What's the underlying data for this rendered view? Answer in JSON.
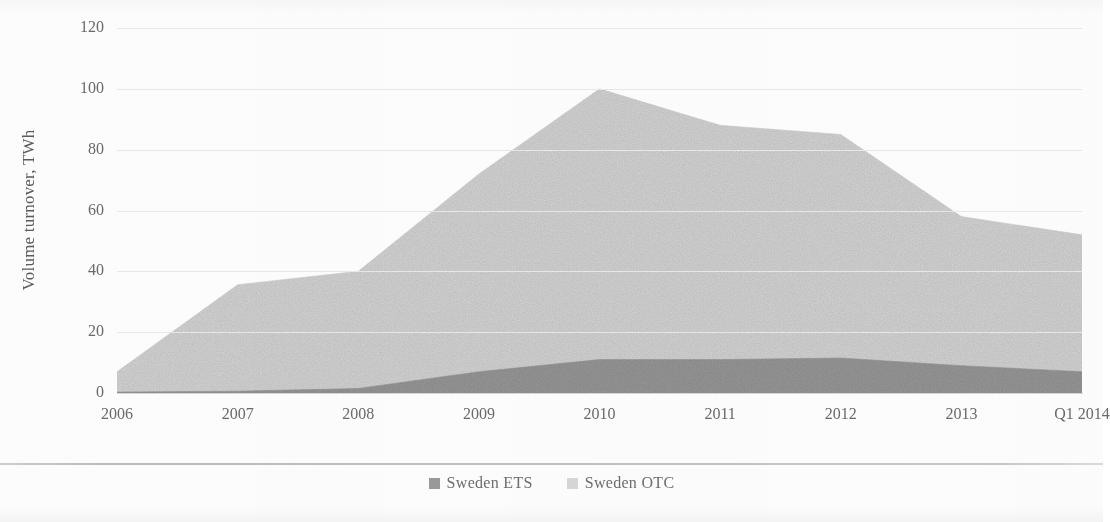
{
  "chart_data": {
    "type": "area",
    "stacked": true,
    "title": "",
    "xlabel": "",
    "ylabel": "Volume turnover, TWh",
    "categories": [
      "2006",
      "2007",
      "2008",
      "2009",
      "2010",
      "2011",
      "2012",
      "2013",
      "Q1 2014"
    ],
    "x_tick_labels": [
      "2006",
      "2007",
      "2008",
      "2009",
      "2010",
      "2011",
      "2012",
      "2013",
      "Q1 2014"
    ],
    "y_tick_labels": [
      "0",
      "20",
      "40",
      "60",
      "80",
      "100",
      "120"
    ],
    "y_ticks": [
      0,
      20,
      40,
      60,
      80,
      100,
      120
    ],
    "ylim": [
      0,
      120
    ],
    "grid": true,
    "grid_axis": "y",
    "legend_position": "bottom",
    "series": [
      {
        "name": "Sweden ETS",
        "color": "#9a9a9a",
        "values": [
          0.3,
          0.6,
          1.5,
          7.0,
          11.0,
          11.0,
          11.5,
          9.0,
          7.0
        ]
      },
      {
        "name": "Sweden OTC",
        "color": "#d8d8d8",
        "values": [
          6.7,
          35.0,
          38.5,
          65.0,
          89.0,
          77.0,
          73.5,
          49.0,
          45.0
        ]
      }
    ],
    "totals": [
      7.0,
      35.6,
      40.0,
      72.0,
      100.0,
      88.0,
      85.0,
      58.0,
      52.0
    ],
    "annotations": []
  },
  "axis": {
    "y_title": "Volume turnover, TWh"
  },
  "legend": {
    "items": [
      {
        "label": "Sweden ETS",
        "color": "#9a9a9a"
      },
      {
        "label": "Sweden OTC",
        "color": "#d8d8d8"
      }
    ]
  }
}
